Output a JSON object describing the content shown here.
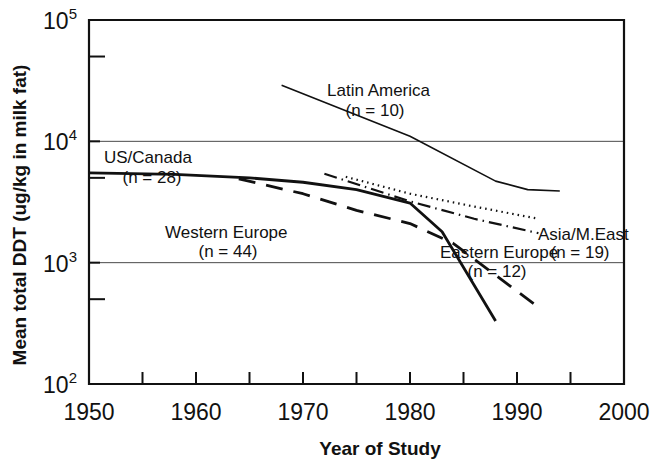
{
  "figure": {
    "background": "#ffffff",
    "ink_color": "#111111"
  },
  "chart_data": {
    "type": "line",
    "title": "",
    "xlabel": "Year of Study",
    "ylabel": "Mean total DDT (ug/kg in milk fat)",
    "yscale": "log",
    "xlim": [
      1950,
      2000
    ],
    "ylim": [
      100,
      100000
    ],
    "grid": "horizontal-major",
    "legend": "inline-annotations",
    "xticks": [
      1950,
      1960,
      1970,
      1980,
      1990,
      2000
    ],
    "xticklabels": [
      "1950",
      "1960",
      "1970",
      "1980",
      "1990",
      "2000"
    ],
    "xminorticks": [
      1955,
      1965,
      1975,
      1985,
      1995
    ],
    "yticks": [
      100,
      1000,
      10000,
      100000
    ],
    "yticklabels": [
      "10",
      "10",
      "10",
      "10"
    ],
    "ytickexponents": [
      "2",
      "3",
      "4",
      "5"
    ],
    "yminorticks": [
      500,
      5000,
      50000
    ],
    "series": [
      {
        "name": "US/Canada",
        "n": 28,
        "label": "US/Canada",
        "sublabel": "(n = 28)",
        "style": "solid",
        "linewidth": 2.8,
        "points": [
          [
            1950,
            5500
          ],
          [
            1958,
            5350
          ],
          [
            1965,
            5000
          ],
          [
            1970,
            4600
          ],
          [
            1975,
            4000
          ],
          [
            1980,
            3100
          ],
          [
            1983,
            1800
          ],
          [
            1988,
            330
          ]
        ]
      },
      {
        "name": "Western Europe",
        "n": 44,
        "label": "Western Europe",
        "sublabel": "(n = 44)",
        "style": "dashed",
        "linewidth": 2.8,
        "points": [
          [
            1964,
            4900
          ],
          [
            1970,
            3700
          ],
          [
            1975,
            2700
          ],
          [
            1980,
            2100
          ],
          [
            1984,
            1450
          ],
          [
            1992,
            430
          ]
        ]
      },
      {
        "name": "Latin America",
        "n": 10,
        "label": "Latin America",
        "sublabel": "(n = 10)",
        "style": "solid",
        "linewidth": 1.6,
        "points": [
          [
            1968,
            29000
          ],
          [
            1980,
            11000
          ],
          [
            1988,
            4700
          ],
          [
            1991,
            4000
          ],
          [
            1994,
            3900
          ]
        ]
      },
      {
        "name": "Asia/M.East",
        "n": 19,
        "label": "Asia/M.East",
        "sublabel": "(n = 19)",
        "style": "dotted",
        "linewidth": 2.2,
        "points": [
          [
            1974,
            5100
          ],
          [
            1980,
            3700
          ],
          [
            1986,
            2900
          ],
          [
            1992,
            2300
          ]
        ]
      },
      {
        "name": "Eastern Europe",
        "n": 12,
        "label": "Eastern Europe",
        "sublabel": "(n = 12)",
        "style": "dashdot",
        "linewidth": 2.2,
        "points": [
          [
            1972,
            5400
          ],
          [
            1980,
            3200
          ],
          [
            1986,
            2300
          ],
          [
            1992,
            1750
          ]
        ]
      }
    ],
    "annotations": [
      {
        "text": "Latin America",
        "sub": "(n = 10)",
        "x": 1980,
        "y": 38000
      },
      {
        "text": "US/Canada",
        "sub": "(n = 28)",
        "x": 1955,
        "y": 8600
      },
      {
        "text": "Asia/M.East",
        "sub": "(n = 19)",
        "x": 1993,
        "y": 2200
      },
      {
        "text": "Western Europe",
        "sub": "(n = 44)",
        "x": 1973,
        "y": 1750
      },
      {
        "text": "Eastern Europe",
        "sub": "(n = 12)",
        "x": 1989,
        "y": 1150
      }
    ]
  },
  "labels": {
    "y_axis_title": "Mean total DDT (ug/kg in milk fat)",
    "x_axis_title": "Year of Study",
    "x_tick_1950": "1950",
    "x_tick_1960": "1960",
    "x_tick_1970": "1970",
    "x_tick_1980": "1980",
    "x_tick_1990": "1990",
    "x_tick_2000": "2000",
    "y_tick_base": "10",
    "y_exp_2": "2",
    "y_exp_3": "3",
    "y_exp_4": "4",
    "y_exp_5": "5",
    "ann_latin_america": "Latin America",
    "ann_latin_america_n": "(n = 10)",
    "ann_us_canada": "US/Canada",
    "ann_us_canada_n": "(n = 28)",
    "ann_asia": "Asia/M.East",
    "ann_asia_n": "(n = 19)",
    "ann_western_europe": "Western Europe",
    "ann_western_europe_n": "(n = 44)",
    "ann_eastern_europe": "Eastern Europe",
    "ann_eastern_europe_n": "(n = 12)"
  }
}
